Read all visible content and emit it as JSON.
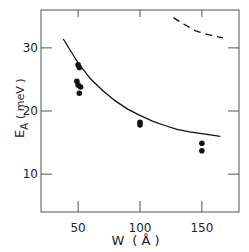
{
  "chart_data": {
    "type": "scatter",
    "title": "",
    "xlabel": "W",
    "xlabel_unit": "(Å)",
    "ylabel": "E",
    "ylabel_subscript": "A",
    "ylabel_unit": "(meV)",
    "xlim": [
      20,
      180
    ],
    "ylim": [
      4,
      36
    ],
    "xticks": [
      50,
      100,
      150
    ],
    "yticks": [
      10,
      20,
      30
    ],
    "grid": false,
    "legend": null,
    "series": [
      {
        "name": "measured",
        "kind": "points",
        "x": [
          50,
          51,
          49,
          50,
          52,
          51,
          100,
          100,
          150,
          150
        ],
        "y": [
          27.3,
          26.9,
          24.7,
          24.1,
          23.8,
          22.8,
          18.2,
          17.8,
          14.9,
          13.7
        ]
      },
      {
        "name": "theory-solid",
        "kind": "line",
        "style": "solid",
        "x": [
          38,
          50,
          60,
          70,
          80,
          90,
          100,
          110,
          120,
          130,
          140,
          150,
          165
        ],
        "y": [
          31.4,
          27.6,
          25.1,
          23.2,
          21.6,
          20.3,
          19.3,
          18.4,
          17.7,
          17.1,
          16.7,
          16.4,
          16.0
        ]
      },
      {
        "name": "theory-dashed",
        "kind": "line",
        "style": "dashed",
        "x": [
          127,
          135,
          145,
          155,
          167
        ],
        "y": [
          34.8,
          33.8,
          32.7,
          32.1,
          31.6
        ]
      }
    ]
  },
  "labels": {
    "x_ticks": [
      "50",
      "100",
      "150"
    ],
    "y_ticks": [
      "10",
      "20",
      "30"
    ],
    "x_title": "W",
    "x_unit": "( Å )",
    "y_title": "E",
    "y_sub": "A",
    "y_unit": "( meV )"
  }
}
